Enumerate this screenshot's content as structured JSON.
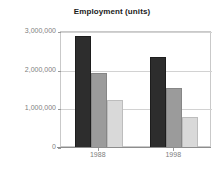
{
  "chart_data": {
    "type": "bar",
    "title": "Employment (units)",
    "xlabel": "",
    "ylabel": "",
    "categories": [
      "1988",
      "1998"
    ],
    "series": [
      {
        "name": "Series 1",
        "color": "#2d2d2d",
        "values": [
          2900000,
          2350000
        ]
      },
      {
        "name": "Series 2",
        "color": "#9b9b9b",
        "values": [
          1930000,
          1540000
        ]
      },
      {
        "name": "Series 3",
        "color": "#d9d9d9",
        "values": [
          1250000,
          810000
        ]
      }
    ],
    "ylim": [
      0,
      3000000
    ],
    "ytick_values": [
      0,
      1000000,
      2000000,
      3000000
    ],
    "ytick_labels": [
      "0",
      "1,000,000",
      "2,000,000",
      "3,000,000"
    ],
    "grid": true,
    "legend": "none",
    "grid_lines_at": [
      1000000,
      2000000,
      3000000
    ]
  }
}
